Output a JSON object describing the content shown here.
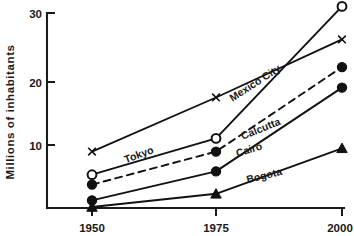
{
  "chart_data": {
    "type": "line",
    "title": "",
    "subtitle": "",
    "xlabel": "",
    "ylabel": "Millions of inhabitants",
    "x": [
      1950,
      1975,
      2000
    ],
    "xticklabels": [
      "1950",
      "1975",
      "2000"
    ],
    "yticks": [
      10,
      20,
      30
    ],
    "yticklabels": [
      "10",
      "20",
      "30"
    ],
    "ylim": [
      0,
      32
    ],
    "xlim": [
      1945,
      2005
    ],
    "grid": false,
    "legend": "inline-labels",
    "series": [
      {
        "name": "Tokyo",
        "label": "Tokyo",
        "marker": "cross",
        "linestyle": "solid",
        "color": "#111111",
        "values": [
          9.0,
          17.2,
          26.0
        ]
      },
      {
        "name": "Mexico City",
        "label": "Mexico City",
        "marker": "open-circle",
        "linestyle": "solid",
        "color": "#111111",
        "values": [
          5.5,
          11.0,
          31.0
        ]
      },
      {
        "name": "Calcutta",
        "label": "Calcutta",
        "marker": "filled-circle",
        "linestyle": "dashed",
        "color": "#111111",
        "values": [
          4.0,
          9.0,
          21.8
        ]
      },
      {
        "name": "Cairo",
        "label": "Cairo",
        "marker": "filled-circle",
        "linestyle": "solid",
        "color": "#111111",
        "values": [
          1.6,
          6.0,
          18.7
        ]
      },
      {
        "name": "Bogota",
        "label": "Bogota",
        "marker": "filled-triangle",
        "linestyle": "solid",
        "color": "#111111",
        "values": [
          0.6,
          2.6,
          9.5
        ]
      }
    ]
  },
  "axes": {
    "y_axis_label": "Millions of inhabitants",
    "y_tick_30": "30",
    "y_tick_20": "20",
    "y_tick_10": "10",
    "x_tick_1950": "1950",
    "x_tick_1975": "1975",
    "x_tick_2000": "2000"
  },
  "labels": {
    "tokyo": "Tokyo",
    "mexico_city": "Mexico City",
    "calcutta": "Calcutta",
    "cairo": "Cairo",
    "bogota": "Bogota"
  }
}
